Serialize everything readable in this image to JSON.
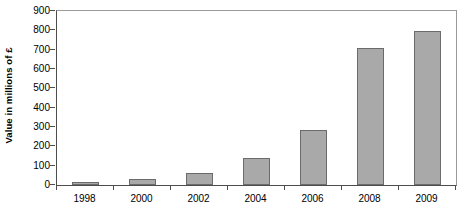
{
  "chart_data": {
    "type": "bar",
    "title": "",
    "xlabel": "",
    "ylabel": "Value in millions of £",
    "categories": [
      "1998",
      "2000",
      "2002",
      "2004",
      "2006",
      "2008",
      "2009"
    ],
    "values": [
      17,
      32,
      62,
      140,
      283,
      710,
      798
    ],
    "ylim": [
      0,
      900
    ],
    "yticks": [
      0,
      100,
      200,
      300,
      400,
      500,
      600,
      700,
      800,
      900
    ],
    "ytick_labels": [
      "0",
      "100",
      "200",
      "300",
      "400",
      "500",
      "600",
      "700",
      "800",
      "900"
    ],
    "grid": false,
    "legend": null,
    "series": [
      {
        "name": "Value in millions of £",
        "values": [
          17,
          32,
          62,
          140,
          283,
          710,
          798
        ]
      }
    ],
    "colors": {
      "bar_fill": "#a9a9a9",
      "bar_stroke": "#6b6b6b",
      "axis": "#4d4d4d",
      "frame": "#9a9a9a",
      "text": "#000000",
      "background": "#ffffff"
    }
  }
}
